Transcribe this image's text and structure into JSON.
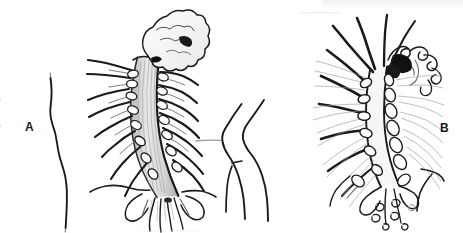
{
  "plate": {
    "width": 463,
    "height": 233,
    "background_color": "#ffffff",
    "ink_color": "#1a1a1a",
    "light_ink_color": "#8a8a8a",
    "panels": [
      {
        "id": "a",
        "label": "A",
        "x": 25,
        "y": 121
      },
      {
        "id": "b",
        "label": "B",
        "x": 440,
        "y": 122
      }
    ],
    "margin_fragments": [
      {
        "id": "fragment-1",
        "text": "c",
        "y": 96
      },
      {
        "id": "fragment-2",
        "text": "s",
        "y": 122
      }
    ],
    "figure_a": {
      "title": "A",
      "description": "Dorsal view line drawing of an elongate segmented invertebrate trunk with paired lateral appendages and a lobed anterior head region",
      "parts": [
        "anterior-lobed-head",
        "median-trunk-axis",
        "left-parapodial-series",
        "right-parapodial-series",
        "left-body-outline",
        "right-body-outline",
        "posterior-root-tuft"
      ]
    },
    "figure_b": {
      "title": "B",
      "description": "Companion line drawing of the same structure showing elongate dorsal setae, segmented podial lobes and scattered posterior ovoid bodies",
      "parts": [
        "anterior-coiled-head",
        "median-trunk-axis",
        "left-seta-series",
        "right-lobe-series",
        "left-body-outline",
        "right-body-outline",
        "posterior-ovoid-bodies"
      ]
    }
  }
}
